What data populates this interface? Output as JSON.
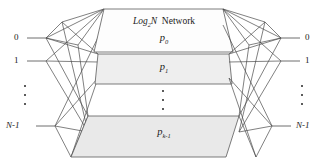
{
  "diagram": {
    "type": "multistage-interconnection-network",
    "title_prefix": "Log",
    "title_subscript": "2",
    "title_suffix": "N",
    "title_word": "Network",
    "planes": [
      {
        "id": "p0",
        "base": "p",
        "subscript": "0",
        "label": "p0",
        "has_title": true
      },
      {
        "id": "p1",
        "base": "p",
        "subscript": "1",
        "label": "p1",
        "has_title": false
      },
      {
        "id": "pk1",
        "base": "p",
        "subscript": "k-1",
        "label": "pk-1",
        "has_title": false
      }
    ],
    "inputs": [
      {
        "label": "0",
        "italic": false
      },
      {
        "label": "1",
        "italic": false
      },
      {
        "label": "N-1",
        "italic": true
      }
    ],
    "outputs": [
      {
        "label": "0",
        "italic": false
      },
      {
        "label": "1",
        "italic": false
      },
      {
        "label": "N-1",
        "italic": true
      }
    ],
    "ellipsis": {
      "left": "vertical-dots",
      "center": "vertical-dots",
      "right": "vertical-dots",
      "dot_count": 3
    },
    "colors": {
      "background": "#ffffff",
      "line": "#4a4a4a",
      "plane_stroke": "#5a5a5a",
      "plane_fill_top": "#fdfdfd",
      "plane_fill_mid": "#eeeeee",
      "plane_fill_bottom": "#e9e9e9",
      "text": "#1a1a1a"
    }
  }
}
